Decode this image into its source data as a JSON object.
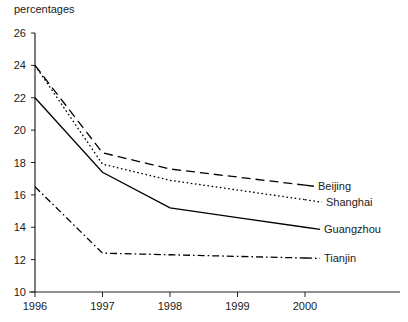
{
  "chart_data": {
    "type": "line",
    "title": "",
    "ylabel": "percentages",
    "xlabel": "",
    "x": [
      "1996",
      "1997",
      "1998",
      "1999",
      "2000"
    ],
    "xlim": [
      1996,
      2000
    ],
    "ylim": [
      10,
      26
    ],
    "yticks": [
      10,
      12,
      14,
      16,
      18,
      20,
      22,
      24,
      26
    ],
    "xticks": [
      "1996",
      "1997",
      "1998",
      "1999",
      "2000"
    ],
    "grid": false,
    "legend_position": "right-inline-labels",
    "series": [
      {
        "name": "Beijing",
        "style": "dashed",
        "color": "#000000",
        "values": [
          24.0,
          18.6,
          17.6,
          17.1,
          16.6
        ]
      },
      {
        "name": "Shanghai",
        "style": "dotted",
        "color": "#000000",
        "values": [
          24.0,
          17.9,
          16.9,
          16.3,
          15.7
        ]
      },
      {
        "name": "Guangzhou",
        "style": "solid",
        "color": "#000000",
        "values": [
          22.0,
          17.4,
          15.2,
          14.6,
          14.0
        ]
      },
      {
        "name": "Tianjin",
        "style": "dash-dot",
        "color": "#000000",
        "values": [
          16.5,
          12.4,
          12.3,
          12.2,
          12.1
        ]
      }
    ]
  },
  "axis": {
    "y_title": "percentages",
    "y_labels": [
      "26",
      "24",
      "22",
      "20",
      "18",
      "16",
      "14",
      "12",
      "10"
    ],
    "x_labels": [
      "1996",
      "1997",
      "1998",
      "1999",
      "2000"
    ]
  },
  "legend": {
    "items": [
      {
        "label": "Beijing"
      },
      {
        "label": "Shanghai"
      },
      {
        "label": "Guangzhou"
      },
      {
        "label": "Tianjin"
      }
    ]
  }
}
